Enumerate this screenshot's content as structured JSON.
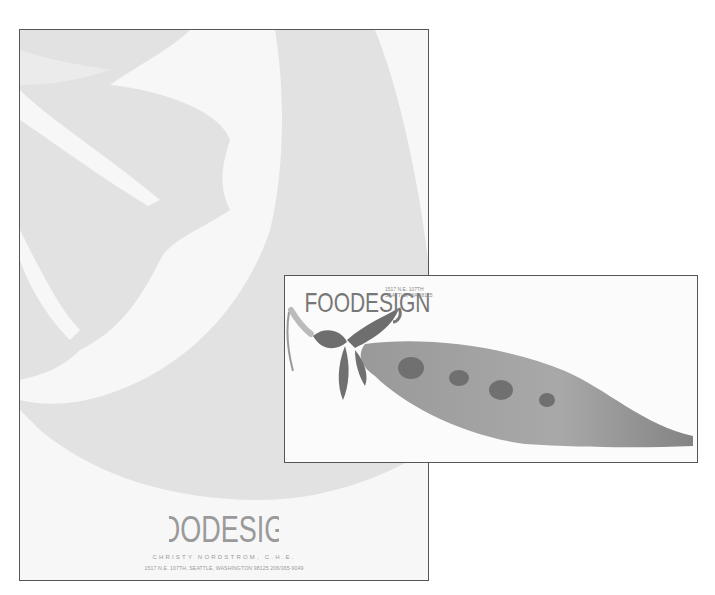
{
  "letterhead": {
    "logo_text": "FOODESIGN",
    "name": "CHRISTY NORDSTROM, C.H.E.",
    "address": "1517 N.E. 107TH, SEATTLE, WASHINGTON 98125   206/365-9049",
    "colors": {
      "background_shape": "#e3e3e3",
      "paper": "#f7f7f7",
      "text": "#9a9a9a"
    }
  },
  "envelope": {
    "logo_text": "FOODESIGN",
    "address_line1": "1517 N.E. 107TH",
    "address_line2": "SEATTLE, WA 98125",
    "colors": {
      "pod": "#8a8a8a",
      "leaves": "#6e6e6e",
      "peas": "#707070"
    }
  }
}
